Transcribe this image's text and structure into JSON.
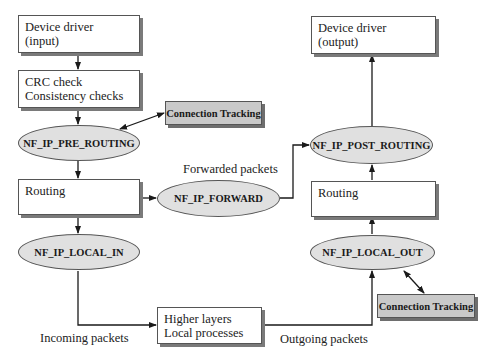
{
  "diagram": {
    "boxes": {
      "device_in": {
        "line1": "Device driver",
        "line2": "(input)"
      },
      "checks": {
        "line1": "CRC check",
        "line2": "Consistency checks"
      },
      "routing_left": {
        "line1": "Routing"
      },
      "higher_layers": {
        "line1": "Higher layers",
        "line2": "Local processes"
      },
      "routing_right": {
        "line1": "Routing"
      },
      "device_out": {
        "line1": "Device driver",
        "line2": "(output)"
      }
    },
    "hooks": {
      "pre_routing": "NF_IP_PRE_ROUTING",
      "forward": "NF_IP_FORWARD",
      "local_in": "NF_IP_LOCAL_IN",
      "local_out": "NF_IP_LOCAL_OUT",
      "post_routing": "NF_IP_POST_ROUTING"
    },
    "conntrack": {
      "top": "Connection Tracking",
      "bottom": "Connection Tracking"
    },
    "edge_labels": {
      "forwarded": "Forwarded packets",
      "incoming": "Incoming packets",
      "outgoing": "Outgoing packets"
    },
    "colors": {
      "hook_fill": "#e0e0e0",
      "conntrack_fill": "#c9c9c9",
      "line": "#1a1a1a"
    }
  }
}
